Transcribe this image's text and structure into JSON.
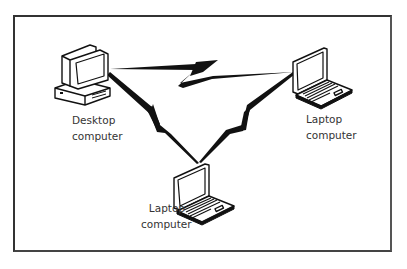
{
  "diagram": {
    "type": "network-wireless-peer",
    "nodes": [
      {
        "id": "desktop",
        "icon": "desktop-computer-icon",
        "label_line1": "Desktop",
        "label_line2": "computer"
      },
      {
        "id": "laptop-right",
        "icon": "laptop-computer-icon",
        "label_line1": "Laptop",
        "label_line2": "computer"
      },
      {
        "id": "laptop-bottom",
        "icon": "laptop-computer-icon",
        "label_line1": "Laptop",
        "label_line2": "computer"
      }
    ],
    "links": [
      {
        "from": "desktop",
        "to": "laptop-right",
        "style": "lightning-bolt"
      },
      {
        "from": "desktop",
        "to": "laptop-bottom",
        "style": "lightning-bolt"
      },
      {
        "from": "laptop-right",
        "to": "laptop-bottom",
        "style": "lightning-bolt"
      }
    ],
    "colors": {
      "line": "#111111",
      "frame": "#333333",
      "background": "#ffffff"
    }
  }
}
